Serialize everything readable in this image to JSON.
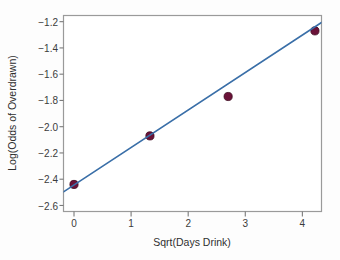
{
  "chart_data": {
    "type": "scatter",
    "title": "",
    "xlabel": "Sqrt(Days Drink)",
    "ylabel": "Log(Odds of Overdrawn)",
    "xlim": [
      -0.184,
      4.335
    ],
    "ylim": [
      -2.646,
      -1.153
    ],
    "grid": false,
    "legend": "none",
    "xticks": [
      0,
      1,
      2,
      3,
      4
    ],
    "xtick_labels": [
      "0",
      "1",
      "2",
      "3",
      "4"
    ],
    "yticks": [
      -1.2,
      -1.4,
      -1.6,
      -1.8,
      -2.0,
      -2.2,
      -2.4,
      -2.6
    ],
    "ytick_labels": [
      "−1.2",
      "−1.4",
      "−1.6",
      "−1.8",
      "−2.0",
      "−2.2",
      "−2.4",
      "−2.6"
    ],
    "series": [
      {
        "name": "observed",
        "type": "scatter",
        "marker": "circle",
        "color": "#6b1238",
        "points": [
          {
            "x": 0.0,
            "y": -2.44
          },
          {
            "x": 1.33,
            "y": -2.07
          },
          {
            "x": 2.7,
            "y": -1.77
          },
          {
            "x": 4.22,
            "y": -1.27
          }
        ]
      },
      {
        "name": "fitted-line",
        "type": "line",
        "color": "#3a6fa8",
        "points": [
          {
            "x": -0.184,
            "y": -2.497
          },
          {
            "x": 4.335,
            "y": -1.206
          }
        ]
      }
    ]
  },
  "style": {
    "background": "#fdfdfd",
    "frame_color": "#9a9a9a",
    "tick_color": "#7a7a7a",
    "marker_color": "#6b1238",
    "marker_edge_color": "#3d0a20",
    "line_color": "#3a6fa8",
    "text_color": "#3b3b3b"
  }
}
